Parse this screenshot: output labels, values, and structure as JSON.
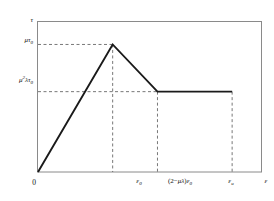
{
  "figure": {
    "background_color": "#ffffff",
    "frame_color": "#8a8a8a",
    "curve_color": "#1a1a1a",
    "dash_color": "#555555"
  },
  "axes": {
    "y_axis_symbol": "τ",
    "x_axis_symbol": "ε",
    "origin_label": "0"
  },
  "y_ticks": [
    {
      "id": "peak-stress",
      "mu": "μ",
      "tau": "τ",
      "sub": "0",
      "text": "μτ₀",
      "value_expr": "mu*tau_0"
    },
    {
      "id": "residual-stress",
      "mu": "μ",
      "exp": "2",
      "lambda": "λ",
      "tau": "τ",
      "sub": "0",
      "text": "μ²λτ₀",
      "value_expr": "mu^2*lambda*tau_0"
    }
  ],
  "x_ticks": [
    {
      "id": "eps-0",
      "eps": "ε",
      "sub": "0",
      "text": "ε₀",
      "value_expr": "eps_0"
    },
    {
      "id": "eps-soften-end",
      "prefix": "(2−",
      "mu": "μ",
      "lambda": "λ",
      "suffix": ")",
      "eps": "ε",
      "sub": "0",
      "text": "(2−μλ)ε₀",
      "value_expr": "(2-mu*lambda)*eps_0"
    },
    {
      "id": "eps-u",
      "eps": "ε",
      "sub": "u",
      "text": "εᵤ",
      "value_expr": "eps_u"
    }
  ],
  "chart_data": {
    "type": "line",
    "title": "",
    "subtitle": "",
    "xlabel": "ε",
    "ylabel": "τ",
    "grid": false,
    "legend": "none",
    "x_tick_labels": [
      "0",
      "ε₀",
      "(2−μλ)ε₀",
      "εᵤ"
    ],
    "x_tick_values": [
      0,
      1.0,
      1.6,
      2.6
    ],
    "y_tick_labels": [
      "μτ₀",
      "μ²λτ₀"
    ],
    "y_tick_values": [
      1.0,
      0.63
    ],
    "xlim": [
      0,
      3.0
    ],
    "ylim": [
      0,
      1.18
    ],
    "series": [
      {
        "name": "shear stress-strain response",
        "color": "#1a1a1a",
        "x": [
          0,
          1.0,
          1.6,
          2.6
        ],
        "y": [
          0,
          1.0,
          0.63,
          0.63
        ],
        "segments": [
          {
            "name": "elastic-rise",
            "from": [
              0,
              0
            ],
            "to": [
              1.0,
              1.0
            ]
          },
          {
            "name": "softening-branch",
            "from": [
              1.0,
              1.0
            ],
            "to": [
              1.6,
              0.63
            ]
          },
          {
            "name": "residual-plateau",
            "from": [
              1.6,
              0.63
            ],
            "to": [
              2.6,
              0.63
            ]
          }
        ]
      }
    ],
    "guide_lines": [
      {
        "name": "peak-horizontal-guide",
        "orientation": "horizontal",
        "value": 1.0,
        "from": 0,
        "to": 1.0,
        "style": "dashed"
      },
      {
        "name": "residual-horizontal-guide",
        "orientation": "horizontal",
        "value": 0.63,
        "from": 0,
        "to": 1.6,
        "style": "dashed"
      },
      {
        "name": "eps0-vertical-guide",
        "orientation": "vertical",
        "value": 1.0,
        "from": 0,
        "to": 1.0,
        "style": "dashed"
      },
      {
        "name": "eps-soften-vertical-guide",
        "orientation": "vertical",
        "value": 1.6,
        "from": 0,
        "to": 0.63,
        "style": "dashed"
      },
      {
        "name": "epsu-vertical-guide",
        "orientation": "vertical",
        "value": 2.6,
        "from": 0,
        "to": 0.63,
        "style": "dashed"
      }
    ]
  }
}
